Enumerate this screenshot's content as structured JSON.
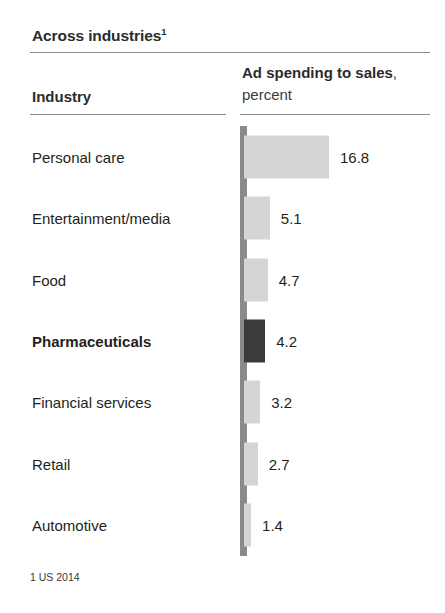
{
  "title": {
    "text": "Across industries",
    "footnote_marker": "1"
  },
  "columns": {
    "industry_header": "Industry",
    "metric_header_bold": "Ad spending to sales",
    "metric_header_rest": ", percent"
  },
  "footnote": "1 US 2014",
  "colors": {
    "bar": "#d5d5d5",
    "bar_highlight": "#3b3b3b",
    "axis": "#8a8a8a",
    "rule": "#8c8c8c",
    "text": "#231f20",
    "background": "#ffffff"
  },
  "chart_data": {
    "type": "bar",
    "orientation": "horizontal",
    "title": "Across industries",
    "subtitle": "",
    "xlabel": "Ad spending to sales, percent",
    "ylabel": "Industry",
    "unit": "percent",
    "grid": false,
    "legend": false,
    "xlim": [
      0,
      16.8
    ],
    "value_labels": true,
    "footnote": "1 US 2014",
    "categories": [
      "Personal care",
      "Entertainment/media",
      "Food",
      "Pharmaceuticals",
      "Financial services",
      "Retail",
      "Automotive"
    ],
    "values": [
      16.8,
      5.1,
      4.7,
      4.2,
      3.2,
      2.7,
      1.4
    ],
    "highlighted_category": "Pharmaceuticals",
    "rows": [
      {
        "label": "Personal care",
        "value": 16.8,
        "value_text": "16.8",
        "highlight": false
      },
      {
        "label": "Entertainment/media",
        "value": 5.1,
        "value_text": "5.1",
        "highlight": false
      },
      {
        "label": "Food",
        "value": 4.7,
        "value_text": "4.7",
        "highlight": false
      },
      {
        "label": "Pharmaceuticals",
        "value": 4.2,
        "value_text": "4.2",
        "highlight": true
      },
      {
        "label": "Financial services",
        "value": 3.2,
        "value_text": "3.2",
        "highlight": false
      },
      {
        "label": "Retail",
        "value": 2.7,
        "value_text": "2.7",
        "highlight": false
      },
      {
        "label": "Automotive",
        "value": 1.4,
        "value_text": "1.4",
        "highlight": false
      }
    ]
  }
}
